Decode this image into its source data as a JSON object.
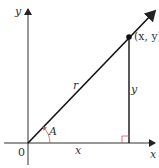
{
  "diagram": {
    "type": "right-triangle-angle-in-standard-position",
    "labels": {
      "y_axis": "y",
      "x_axis": "x",
      "origin": "0",
      "point": "(x, y)",
      "hypotenuse": "r",
      "opposite": "y",
      "adjacent": "x",
      "angle": "A"
    },
    "colors": {
      "lines": "#111111",
      "angle_arc": "#d9534f",
      "right_angle_marker": "#d9534f"
    }
  }
}
